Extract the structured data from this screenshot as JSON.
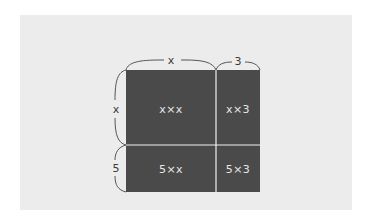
{
  "diagram": {
    "title": "",
    "colors": {
      "background": "#ececec",
      "cell_fill": "#4a4a4a",
      "cell_text": "#e6e6e6",
      "divider": "#f0f0f0",
      "brace": "#555555",
      "label_text": "#3a3a3a"
    },
    "top_labels": [
      {
        "text": "x",
        "segment": "left-column-width"
      },
      {
        "text": "3",
        "segment": "right-column-width"
      }
    ],
    "side_labels": [
      {
        "text": "x",
        "segment": "top-row-height"
      },
      {
        "text": "5",
        "segment": "bottom-row-height"
      }
    ],
    "cells": [
      {
        "label": "x×x",
        "row": 0,
        "col": 0
      },
      {
        "label": "x×3",
        "row": 0,
        "col": 1
      },
      {
        "label": "5×x",
        "row": 1,
        "col": 0
      },
      {
        "label": "5×3",
        "row": 1,
        "col": 1
      }
    ]
  }
}
